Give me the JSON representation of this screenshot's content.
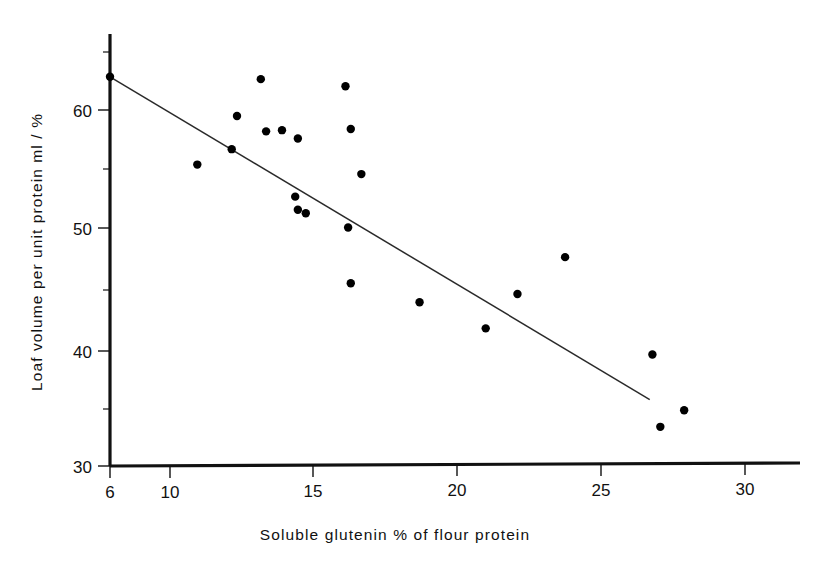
{
  "figure": {
    "background_color": "#ffffff",
    "ink_color": "#000000"
  },
  "chart_data": {
    "type": "scatter",
    "title": "",
    "subtitle": "",
    "xlabel": "Soluble glutenin % of flour protein",
    "ylabel": "Loaf volume per unit protein ml / %",
    "xlim": [
      6,
      32
    ],
    "ylim": [
      30,
      65
    ],
    "grid": false,
    "legend": null,
    "x_ticks_major": [
      6,
      10,
      15,
      20,
      25,
      30
    ],
    "x_tick_labels": [
      "6",
      "10",
      "15",
      "20",
      "25",
      "30"
    ],
    "y_ticks_major": [
      30,
      40,
      50,
      60
    ],
    "y_tick_labels": [
      "30",
      "40",
      "50",
      "60"
    ],
    "y_ticks_minor": [
      35,
      45,
      55,
      65
    ],
    "marker": "filled-circle",
    "marker_color": "#000000",
    "marker_radius": 4.2,
    "points": [
      {
        "x": 6.0,
        "y": 62.8
      },
      {
        "x": 9.3,
        "y": 55.4
      },
      {
        "x": 10.6,
        "y": 56.7
      },
      {
        "x": 11.7,
        "y": 62.6
      },
      {
        "x": 10.8,
        "y": 59.5
      },
      {
        "x": 11.9,
        "y": 58.2
      },
      {
        "x": 12.5,
        "y": 58.3
      },
      {
        "x": 13.1,
        "y": 57.6
      },
      {
        "x": 13.0,
        "y": 52.7
      },
      {
        "x": 13.1,
        "y": 51.6
      },
      {
        "x": 13.4,
        "y": 51.3
      },
      {
        "x": 14.9,
        "y": 62.0
      },
      {
        "x": 15.1,
        "y": 58.4
      },
      {
        "x": 15.0,
        "y": 50.1
      },
      {
        "x": 15.1,
        "y": 45.4
      },
      {
        "x": 15.5,
        "y": 54.6
      },
      {
        "x": 17.7,
        "y": 43.8
      },
      {
        "x": 20.2,
        "y": 41.6
      },
      {
        "x": 21.4,
        "y": 44.5
      },
      {
        "x": 23.2,
        "y": 47.6
      },
      {
        "x": 26.5,
        "y": 39.4
      },
      {
        "x": 26.8,
        "y": 33.3
      },
      {
        "x": 27.7,
        "y": 34.7
      }
    ],
    "fit_line": {
      "type": "linear-regression",
      "x_start": 6.0,
      "y_start": 62.8,
      "x_end": 26.4,
      "y_end": 35.6
    }
  }
}
